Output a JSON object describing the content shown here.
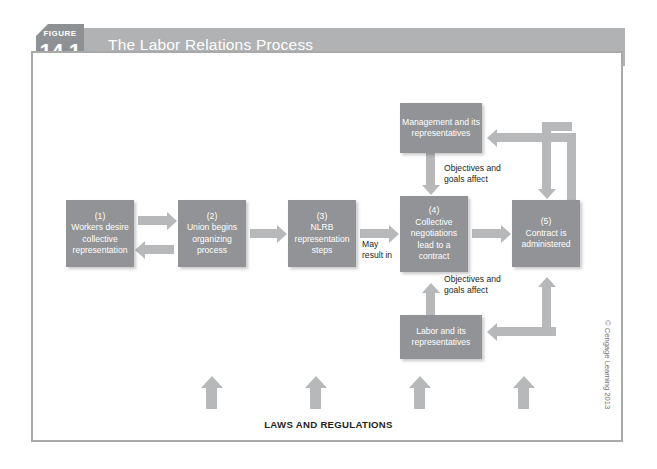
{
  "figure": {
    "label": "FIGURE",
    "number": "14.1",
    "title": "The Labor Relations Process"
  },
  "diagram": {
    "type": "flowchart",
    "boxes": [
      {
        "id": "box1",
        "number": "(1)",
        "text": "Workers desire collective representation"
      },
      {
        "id": "box2",
        "number": "(2)",
        "text": "Union begins organizing process"
      },
      {
        "id": "box3",
        "number": "(3)",
        "text": "NLRB representation steps"
      },
      {
        "id": "box4",
        "number": "(4)",
        "text": "Collective negotiations lead to a contract"
      },
      {
        "id": "box5",
        "number": "(5)",
        "text": "Contract is administered"
      },
      {
        "id": "management",
        "number": "",
        "text": "Management and its representatives"
      },
      {
        "id": "labor",
        "number": "",
        "text": "Labor and its representatives"
      }
    ],
    "edge_labels": {
      "may_result_in": "May result in",
      "objectives_top": "Objectives and goals affect",
      "objectives_bottom": "Objectives and goals affect"
    },
    "foundation_label": "LAWS AND REGULATIONS",
    "foundation_arrow_count": 4
  },
  "credit": "© Cengage Learning 2013",
  "colors": {
    "header_bar": "#b0b2b4",
    "figure_tab": "#8e9194",
    "box_fill": "#919396",
    "arrow": "#b6b8ba",
    "frame_border": "#a9a9a9",
    "text_dark": "#231f20"
  }
}
